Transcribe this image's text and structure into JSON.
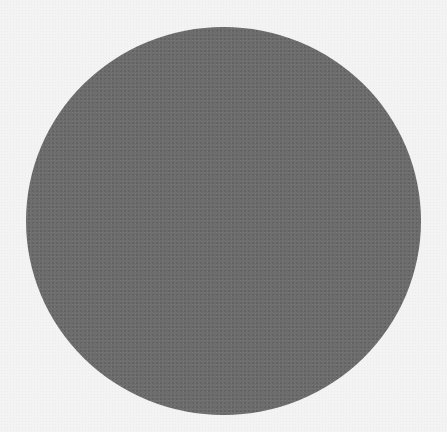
{
  "image": {
    "shape": "circle",
    "colors": {
      "background": "#f3f3f3",
      "disc": "#6d6d6d"
    }
  }
}
